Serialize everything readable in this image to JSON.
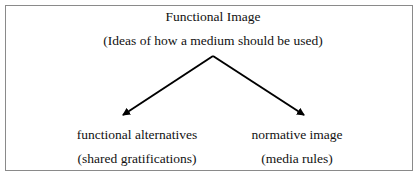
{
  "diagram": {
    "root": {
      "title": "Functional Image",
      "subtitle": "(Ideas of how a medium should be used)"
    },
    "children": [
      {
        "title": "functional alternatives",
        "subtitle": "(shared gratifications)"
      },
      {
        "title": "normative image",
        "subtitle": "(media rules)"
      }
    ],
    "edges": [
      {
        "from": "root",
        "to": "children.0",
        "type": "arrow"
      },
      {
        "from": "root",
        "to": "children.1",
        "type": "arrow"
      }
    ],
    "colors": {
      "border": "#8a8a8a",
      "line": "#000000",
      "text": "#111111"
    }
  }
}
